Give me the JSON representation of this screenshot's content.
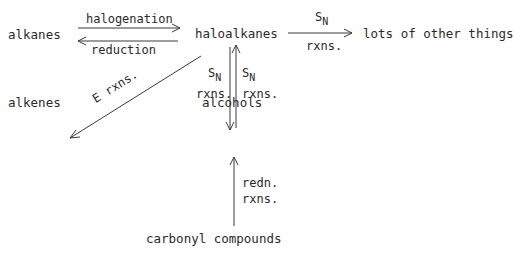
{
  "nodes": {
    "alkanes": "alkanes",
    "haloalkanes": "haloalkanes",
    "other": "lots of other things",
    "alkenes": "alkenes",
    "alcohols": "alcohols",
    "carbonyl": "carbonyl compounds"
  },
  "edges": {
    "halogenation": "halogenation",
    "reduction": "reduction",
    "sn_top_S": "S",
    "sn_top_N": "N",
    "sn_top_rxns": "rxns.",
    "e_rxns": "E rxns.",
    "sn_left_S": "S",
    "sn_left_N": "N",
    "sn_left_rxns": "rxns.",
    "sn_right_S": "S",
    "sn_right_N": "N",
    "sn_right_rxns": "rxns.",
    "redn": "redn.",
    "redn_rxns": "rxns."
  },
  "colors": {
    "line": "#3a3a3a",
    "text": "#2a2a2a"
  }
}
